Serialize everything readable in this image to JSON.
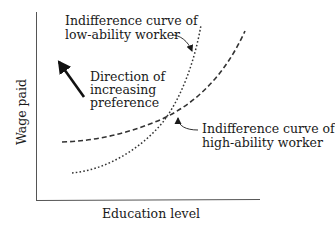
{
  "diagram": {
    "type": "indifference-curves",
    "axes": {
      "x_label": "Education level",
      "y_label": "Wage paid"
    },
    "curves": [
      {
        "id": "low-ability",
        "style": "dotted",
        "label_lines": [
          "Indifference curve of",
          "low-ability worker"
        ],
        "description": "Steeper curve; crosses the high-ability curve from below"
      },
      {
        "id": "high-ability",
        "style": "dashed",
        "label_lines": [
          "Indifference curve of",
          "high-ability worker"
        ],
        "description": "Flatter curve"
      }
    ],
    "annotation": {
      "lines": [
        "Direction of",
        "increasing",
        "preference"
      ],
      "arrow_direction": "up-left"
    },
    "colors": {
      "ink": "#1a1a1a",
      "curve": "#333333",
      "background": "#ffffff"
    }
  }
}
